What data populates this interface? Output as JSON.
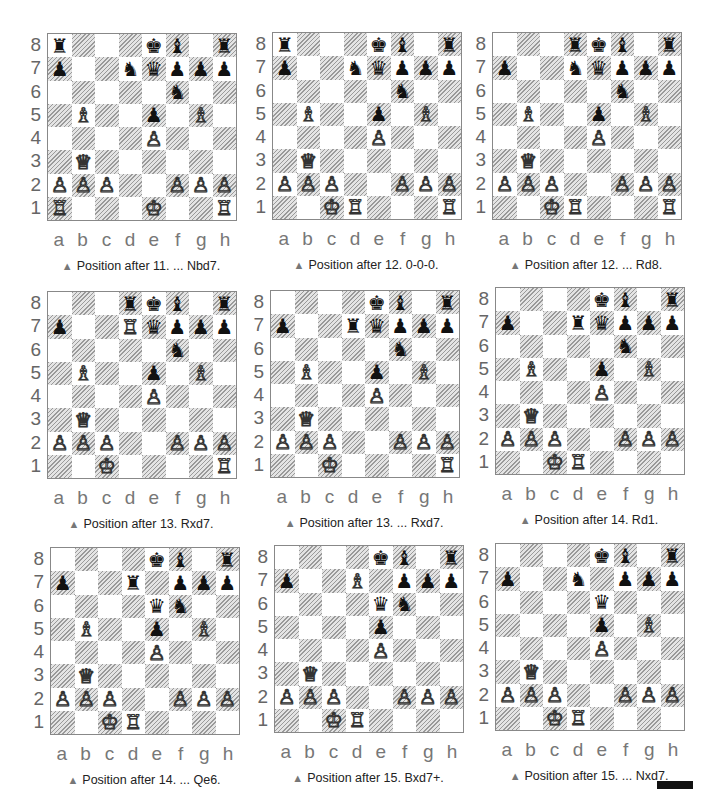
{
  "diagrams": [
    {
      "caption": "Position after 11. ... Nbd7.",
      "fen": "r3kb1r/p2nqppp/5n2/1B2p1B1/4P3/1Q6/PPP2PPP/R3K2R"
    },
    {
      "caption": "Position after 12. 0-0-0.",
      "fen": "r3kb1r/p2nqppp/5n2/1B2p1B1/4P3/1Q6/PPP2PPP/2KR3R"
    },
    {
      "caption": "Position after 12. ... Rd8.",
      "fen": "3rkb1r/p2nqppp/5n2/1B2p1B1/4P3/1Q6/PPP2PPP/2KR3R"
    },
    {
      "caption": "Position after 13. Rxd7.",
      "fen": "3rkb1r/p2Rqppp/5n2/1B2p1B1/4P3/1Q6/PPP2PPP/2K4R"
    },
    {
      "caption": "Position after 13. ... Rxd7.",
      "fen": "4kb1r/p2rqppp/5n2/1B2p1B1/4P3/1Q6/PPP2PPP/2K4R"
    },
    {
      "caption": "Position after 14. Rd1.",
      "fen": "4kb1r/p2rqppp/5n2/1B2p1B1/4P3/1Q6/PPP2PPP/2KR4"
    },
    {
      "caption": "Position after 14. ... Qe6.",
      "fen": "4kb1r/p2r1ppp/4qn2/1B2p1B1/4P3/1Q6/PPP2PPP/2KR4"
    },
    {
      "caption": "Position after 15. Bxd7+.",
      "fen": "4kb1r/p2B1ppp/4qn2/4p3/4P3/1Q6/PPP2PPP/2KR4"
    },
    {
      "caption": "Position after 15. ... Nxd7.",
      "fen": "4kb1r/p2n1ppp/4q3/4p1B1/4P3/1Q6/PPP2PPP/2KR4"
    }
  ],
  "ranks": [
    "8",
    "7",
    "6",
    "5",
    "4",
    "3",
    "2",
    "1"
  ],
  "files": [
    "a",
    "b",
    "c",
    "d",
    "e",
    "f",
    "g",
    "h"
  ],
  "caption_marker": "▲",
  "colors": {
    "dark_square": "#d8d8d8",
    "light_square": "#ffffff",
    "caption_marker": "#777777"
  }
}
